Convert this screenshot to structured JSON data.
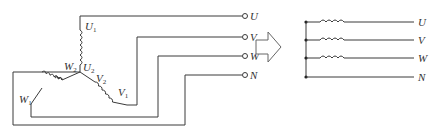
{
  "diagram": {
    "left": {
      "winding_labels": [
        {
          "id": "U1",
          "base": "U",
          "sub": "1"
        },
        {
          "id": "U2",
          "base": "U",
          "sub": "2"
        },
        {
          "id": "V1",
          "base": "V",
          "sub": "1"
        },
        {
          "id": "V2",
          "base": "V",
          "sub": "2"
        },
        {
          "id": "W1",
          "base": "W",
          "sub": "1"
        },
        {
          "id": "W2",
          "base": "W",
          "sub": "2"
        }
      ],
      "terminals": [
        "U",
        "V",
        "W",
        "N"
      ]
    },
    "arrow": "transform-arrow",
    "right": {
      "lines": [
        "U",
        "V",
        "W",
        "N"
      ],
      "coils_on": [
        "U",
        "V",
        "W"
      ]
    }
  }
}
